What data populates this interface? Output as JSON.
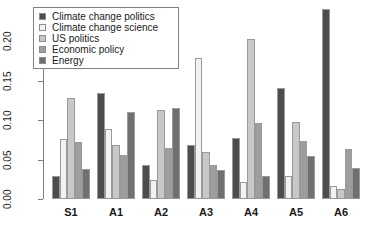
{
  "chart_data": {
    "type": "bar",
    "title": "",
    "subtitle": "",
    "xlabel": "",
    "ylabel": "",
    "grid": false,
    "legend_position": "top-left",
    "categories": [
      "S1",
      "A1",
      "A2",
      "A3",
      "A4",
      "A5",
      "A6"
    ],
    "ylim": [
      0.0,
      0.2425
    ],
    "yticks": [
      "0.00",
      "0.05",
      "0.10",
      "0.15",
      "0.20"
    ],
    "ytick_values": [
      0.0,
      0.05,
      0.1,
      0.15,
      0.2
    ],
    "series": [
      {
        "name": "Climate change politics",
        "color": "#4d4d4d",
        "values": [
          0.029,
          0.135,
          0.043,
          0.069,
          0.077,
          0.141,
          0.241
        ]
      },
      {
        "name": "Climate change science",
        "color": "#f2f2f2",
        "values": [
          0.076,
          0.089,
          0.024,
          0.179,
          0.021,
          0.029,
          0.016
        ]
      },
      {
        "name": "US politics",
        "color": "#c8c8c8",
        "values": [
          0.128,
          0.068,
          0.113,
          0.06,
          0.203,
          0.098,
          0.013
        ]
      },
      {
        "name": "Economic policy",
        "color": "#9e9e9e",
        "values": [
          0.073,
          0.056,
          0.065,
          0.043,
          0.097,
          0.074,
          0.064
        ]
      },
      {
        "name": "Energy",
        "color": "#707070",
        "values": [
          0.038,
          0.11,
          0.115,
          0.037,
          0.029,
          0.055,
          0.039
        ]
      }
    ]
  },
  "legend": {
    "entries": [
      {
        "label": "Climate change politics",
        "color": "#4d4d4d"
      },
      {
        "label": "Climate change science",
        "color": "#f2f2f2"
      },
      {
        "label": "US politics",
        "color": "#c8c8c8"
      },
      {
        "label": "Economic policy",
        "color": "#9e9e9e"
      },
      {
        "label": "Energy",
        "color": "#707070"
      }
    ]
  },
  "axis": {
    "y_tick_labels": [
      "0.00",
      "0.05",
      "0.10",
      "0.15",
      "0.20"
    ],
    "x_tick_labels": [
      "S1",
      "A1",
      "A2",
      "A3",
      "A4",
      "A5",
      "A6"
    ],
    "axis_color": "#808080"
  }
}
